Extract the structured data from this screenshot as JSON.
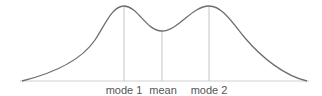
{
  "diagram": {
    "type": "bimodal-distribution",
    "colors": {
      "curve": "#6e6e6e",
      "baseline": "#cfcfcf",
      "markers": "#c4c4c4",
      "labels": "#555555"
    },
    "markers": [
      {
        "id": "mode1",
        "label": "mode 1",
        "x": 124,
        "y_top": 6
      },
      {
        "id": "mean",
        "label": "mean",
        "x": 162,
        "y_top": 31
      },
      {
        "id": "mode2",
        "label": "mode 2",
        "x": 209,
        "y_top": 6
      }
    ]
  }
}
